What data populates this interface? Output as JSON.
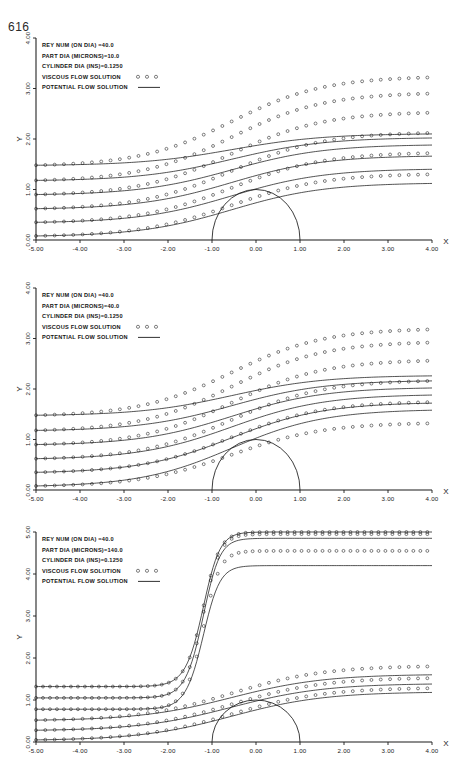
{
  "page": {
    "number": "616"
  },
  "figure": {
    "panel_count": 3
  },
  "panels": [
    {
      "id": "panel-reynolds-40-part-10",
      "legend": {
        "lines": [
          {
            "label": "REY NUM  (ON DIA) =40.0",
            "sample": "none"
          },
          {
            "label": "PART DIA (MICRONS)=10.0",
            "sample": "none"
          },
          {
            "label": "CYLINDER DIA (INS)=0.1250",
            "sample": "none"
          },
          {
            "label": "VISCOUS FLOW SOLUTION",
            "sample": "circles"
          },
          {
            "label": "POTENTIAL FLOW SOLUTION",
            "sample": "line"
          }
        ]
      },
      "axes": {
        "xlabel": "X",
        "ylabel": "Y",
        "xticks": [
          "-5.00",
          "-4.00",
          "-3.00",
          "-2.00",
          "-1.00",
          "0.00",
          "1.00",
          "2.00",
          "3.00",
          "4.00"
        ],
        "yticks": [
          "0.00",
          "1.00",
          "2.00",
          "3.00",
          "4.00"
        ],
        "xlim": [
          -5.0,
          4.0
        ],
        "ylim": [
          0.0,
          4.0
        ]
      }
    },
    {
      "id": "panel-reynolds-40-part-40",
      "legend": {
        "lines": [
          {
            "label": "REY NUM  (ON DIA) =40.0",
            "sample": "none"
          },
          {
            "label": "PART DIA (MICRONS)=40.0",
            "sample": "none"
          },
          {
            "label": "CYLINDER DIA (INS)=0.1250",
            "sample": "none"
          },
          {
            "label": "VISCOUS FLOW SOLUTION",
            "sample": "circles"
          },
          {
            "label": "POTENTIAL FLOW SOLUTION",
            "sample": "line"
          }
        ]
      },
      "axes": {
        "xlabel": "X",
        "ylabel": "Y",
        "xticks": [
          "-5.00",
          "-4.00",
          "-3.00",
          "-2.00",
          "-1.00",
          "0.00",
          "1.00",
          "2.00",
          "3.00",
          "4.00"
        ],
        "yticks": [
          "0.00",
          "1.00",
          "2.00",
          "3.00",
          "4.00"
        ],
        "xlim": [
          -5.0,
          4.0
        ],
        "ylim": [
          0.0,
          4.0
        ]
      }
    },
    {
      "id": "panel-reynolds-40-part-140",
      "legend": {
        "lines": [
          {
            "label": "REY NUM  (ON DIA) =40.0",
            "sample": "none"
          },
          {
            "label": "PART DIA (MICRONS)=140.0",
            "sample": "none"
          },
          {
            "label": "CYLINDER DIA (INS)=0.1250",
            "sample": "none"
          },
          {
            "label": "VISCOUS FLOW SOLUTION",
            "sample": "circles"
          },
          {
            "label": "POTENTIAL FLOW SOLUTION",
            "sample": "line"
          }
        ]
      },
      "axes": {
        "xlabel": "X",
        "ylabel": "Y",
        "xticks": [
          "-5.00",
          "-4.00",
          "-3.00",
          "-2.00",
          "-2.40",
          "-1.00",
          "0.00",
          "1.00",
          "2.00",
          "3.00",
          "4.00"
        ],
        "yticks": [
          "0.00",
          "1.00",
          "2.00",
          "3.00",
          "4.00",
          "5.00"
        ],
        "xlim": [
          -5.0,
          4.0
        ],
        "ylim": [
          0.0,
          5.0
        ]
      }
    }
  ],
  "chart_data": [
    {
      "type": "line",
      "title": "REY NUM (ON DIA) =40.0 / PART DIA (MICRONS)=10.0",
      "xlabel": "X",
      "ylabel": "Y",
      "xlim": [
        -5.0,
        4.0
      ],
      "ylim": [
        0.0,
        4.0
      ],
      "grid": false,
      "legend_position": "upper-left",
      "annotations": [
        "REY NUM  (ON DIA) =40.0",
        "PART DIA (MICRONS)=10.0",
        "CYLINDER DIA (INS)=0.1250"
      ],
      "obstacle": {
        "shape": "semicircle",
        "center_x": 0.0,
        "center_y": 0.0,
        "radius": 1.0
      },
      "series": [
        {
          "name": "VISCOUS FLOW SOLUTION",
          "style": "circles",
          "start_y": [
            0.08,
            0.35,
            0.62,
            0.9,
            1.18,
            1.48
          ],
          "end_y": [
            1.3,
            1.72,
            2.12,
            2.52,
            2.9,
            3.22
          ]
        },
        {
          "name": "POTENTIAL FLOW SOLUTION",
          "style": "line",
          "start_y": [
            0.08,
            0.35,
            0.62,
            0.9,
            1.18,
            1.48
          ],
          "end_y": [
            1.12,
            1.4,
            1.66,
            1.88,
            2.02,
            2.1
          ]
        }
      ]
    },
    {
      "type": "line",
      "title": "REY NUM (ON DIA) =40.0 / PART DIA (MICRONS)=40.0",
      "xlabel": "X",
      "ylabel": "Y",
      "xlim": [
        -5.0,
        4.0
      ],
      "ylim": [
        0.0,
        4.0
      ],
      "grid": false,
      "legend_position": "upper-left",
      "annotations": [
        "REY NUM  (ON DIA) =40.0",
        "PART DIA (MICRONS)=40.0",
        "CYLINDER DIA (INS)=0.1250"
      ],
      "obstacle": {
        "shape": "semicircle",
        "center_x": 0.0,
        "center_y": 0.0,
        "radius": 1.0
      },
      "series": [
        {
          "name": "VISCOUS FLOW SOLUTION",
          "style": "circles",
          "start_y": [
            0.08,
            0.35,
            0.62,
            0.9,
            1.18,
            1.48
          ],
          "end_y": [
            1.32,
            1.74,
            2.16,
            2.56,
            2.92,
            3.18
          ]
        },
        {
          "name": "POTENTIAL FLOW SOLUTION",
          "style": "line",
          "start_y": [
            0.08,
            0.35,
            0.62,
            0.9,
            1.18,
            1.48
          ],
          "end_y": [
            1.58,
            1.72,
            1.88,
            2.02,
            2.16,
            2.26
          ]
        }
      ]
    },
    {
      "type": "line",
      "title": "REY NUM (ON DIA) =40.0 / PART DIA (MICRONS)=140.0",
      "xlabel": "X",
      "ylabel": "Y",
      "xlim": [
        -5.0,
        4.0
      ],
      "ylim": [
        0.0,
        5.0
      ],
      "grid": false,
      "legend_position": "upper-left",
      "annotations": [
        "REY NUM  (ON DIA) =40.0",
        "PART DIA (MICRONS)=140.0",
        "CYLINDER DIA (INS)=0.1250"
      ],
      "obstacle": {
        "shape": "semicircle",
        "center_x": 0.0,
        "center_y": 0.0,
        "radius": 1.0
      },
      "series": [
        {
          "name": "VISCOUS FLOW SOLUTION",
          "style": "circles",
          "start_y": [
            0.05,
            0.28,
            0.52,
            0.78,
            1.05,
            1.32
          ],
          "end_y": [
            1.28,
            1.52,
            1.8,
            4.55,
            4.95,
            5.0
          ]
        },
        {
          "name": "POTENTIAL FLOW SOLUTION",
          "style": "line",
          "start_y": [
            0.05,
            0.28,
            0.52,
            0.78,
            1.05,
            1.32
          ],
          "end_y": [
            1.18,
            1.38,
            1.6,
            4.2,
            4.85,
            5.0
          ]
        }
      ]
    }
  ]
}
